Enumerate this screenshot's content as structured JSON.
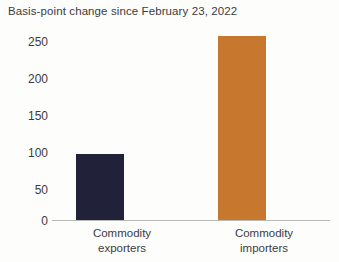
{
  "chart_data": {
    "type": "bar",
    "title": "Basis-point change since February 23, 2022",
    "subtitle": "",
    "xlabel": "",
    "ylabel": "",
    "categories": [
      "Commodity exporters",
      "Commodity importers"
    ],
    "category_lines": [
      [
        "Commodity",
        "exporters"
      ],
      [
        "Commodity",
        "importers"
      ]
    ],
    "values": [
      88,
      242
    ],
    "ylim": [
      0,
      250
    ],
    "yticks": [
      0,
      50,
      100,
      150,
      200,
      250
    ],
    "ytick_labels": [
      "0",
      "50",
      "100",
      "150",
      "200",
      "250"
    ],
    "grid": false,
    "legend": null,
    "bar_colors": [
      "#21213a",
      "#c8772f"
    ],
    "axis_color": "#b9b9b4",
    "text_color": "#3b3b40",
    "background_color": "#fdfdfb"
  }
}
